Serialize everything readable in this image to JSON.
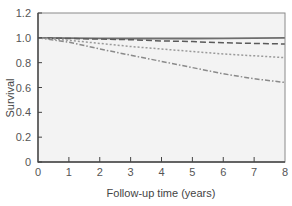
{
  "chart_data": {
    "type": "line",
    "title": "",
    "xlabel": "Follow-up time (years)",
    "ylabel": "Survival",
    "xlim": [
      0,
      8
    ],
    "ylim": [
      0,
      1.2
    ],
    "x_ticks": [
      0,
      1,
      2,
      3,
      4,
      5,
      6,
      7,
      8
    ],
    "y_ticks": [
      "0",
      "0.2",
      "0.4",
      "0.6",
      "0.8",
      "1.0",
      "1.2"
    ],
    "grid": false,
    "legend": null,
    "x": [
      0,
      1,
      2,
      3,
      4,
      5,
      6,
      7,
      8
    ],
    "series": [
      {
        "name": "solid",
        "style": "solid",
        "color": "#6e6e6e",
        "values": [
          1.0,
          0.998,
          0.996,
          0.995,
          0.995,
          0.995,
          0.996,
          0.998,
          1.0
        ]
      },
      {
        "name": "dashed",
        "style": "dashed",
        "color": "#5a5a5a",
        "values": [
          1.0,
          0.995,
          0.99,
          0.985,
          0.975,
          0.97,
          0.96,
          0.955,
          0.95
        ]
      },
      {
        "name": "dotted",
        "style": "dotted",
        "color": "#9a9a9a",
        "values": [
          1.0,
          0.98,
          0.955,
          0.93,
          0.91,
          0.89,
          0.87,
          0.855,
          0.84
        ]
      },
      {
        "name": "dash-dot",
        "style": "dashdot",
        "color": "#8a8a8a",
        "values": [
          1.0,
          0.965,
          0.91,
          0.86,
          0.81,
          0.76,
          0.71,
          0.67,
          0.64
        ]
      }
    ]
  },
  "layout": {
    "plot_left": 38,
    "plot_right": 285,
    "plot_top": 13,
    "plot_bottom": 162,
    "plot_bg": "#f3f3f3",
    "axis_color": "#444444"
  }
}
